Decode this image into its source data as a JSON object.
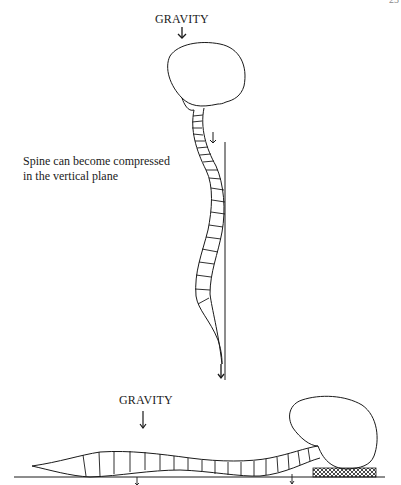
{
  "page": {
    "number": "23"
  },
  "figure_top": {
    "gravity_label": "GRAVITY",
    "caption_line1": "Spine can become compressed",
    "caption_line2": "in the vertical plane",
    "icons": [
      "gravity-arrow-icon",
      "neck-arrow-icon",
      "base-arrow-icon"
    ]
  },
  "figure_bottom": {
    "gravity_label": "GRAVITY",
    "icons": [
      "gravity-arrow-icon",
      "ground-arrow-icon",
      "ground-arrow-icon",
      "pillow-support"
    ]
  },
  "colors": {
    "ink": "#1a1a1a",
    "background": "#ffffff"
  }
}
